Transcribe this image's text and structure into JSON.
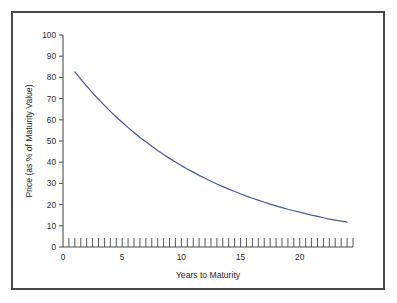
{
  "figure": {
    "background_color": "#ffffff",
    "frame_color": "#4a4a4a"
  },
  "chart_data": {
    "type": "line",
    "title": "",
    "subtitle": "",
    "xlabel": "Years to Maturity",
    "ylabel": "Price (as % of Maturity Value)",
    "xlim": [
      0,
      24.5
    ],
    "ylim": [
      0,
      100
    ],
    "grid": false,
    "legend": null,
    "legend_position": "none",
    "series_color": "#4a5a9e",
    "x_ticks": [
      0,
      5,
      10,
      15,
      20
    ],
    "x_tick_labels": [
      "0",
      "5",
      "10",
      "15",
      "20"
    ],
    "x_minor_tick_step": 0.5,
    "x_minor_tick_direction": "inward-up",
    "y_ticks": [
      0,
      10,
      20,
      30,
      40,
      50,
      60,
      70,
      80,
      90,
      100
    ],
    "y_tick_labels": [
      "0",
      "10",
      "20",
      "30",
      "40",
      "50",
      "60",
      "70",
      "80",
      "90",
      "100"
    ],
    "series": [
      {
        "name": "Zero-coupon bond price",
        "x": [
          1,
          1.5,
          2,
          2.5,
          3,
          3.5,
          4,
          4.5,
          5,
          5.5,
          6,
          6.5,
          7,
          7.5,
          8,
          8.5,
          9,
          9.5,
          10,
          10.5,
          11,
          11.5,
          12,
          12.5,
          13,
          13.5,
          14,
          14.5,
          15,
          15.5,
          16,
          16.5,
          17,
          17.5,
          18,
          18.5,
          19,
          19.5,
          20,
          20.5,
          21,
          21.5,
          22,
          22.5,
          23,
          23.5,
          24
        ],
        "values": [
          82.6,
          79.2,
          75.9,
          72.7,
          69.7,
          66.8,
          64.0,
          61.3,
          58.8,
          56.3,
          54.0,
          51.7,
          49.6,
          47.5,
          45.5,
          43.6,
          41.8,
          40.1,
          38.4,
          36.8,
          35.3,
          33.8,
          32.4,
          31.0,
          29.7,
          28.5,
          27.3,
          26.2,
          25.1,
          24.0,
          23.0,
          22.1,
          21.1,
          20.2,
          19.4,
          18.6,
          17.8,
          17.1,
          16.4,
          15.7,
          15.0,
          14.4,
          13.8,
          13.2,
          12.7,
          12.2,
          11.7
        ]
      }
    ],
    "annotations": []
  }
}
